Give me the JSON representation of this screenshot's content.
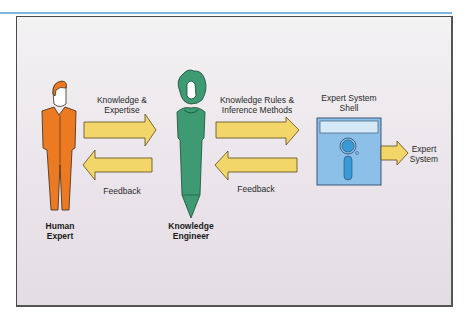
{
  "diagram": {
    "nodes": [
      {
        "id": "human-expert",
        "label_line1": "Human",
        "label_line2": "Expert",
        "figure_color": "#ec7a22"
      },
      {
        "id": "knowledge-engineer",
        "label_line1": "Knowledge",
        "label_line2": "Engineer",
        "figure_color": "#3d9a72"
      },
      {
        "id": "expert-system-shell",
        "label_line1": "Expert System",
        "label_line2": "Shell",
        "icon": "floppy-disk-icon",
        "icon_color": "#8cc0e8"
      },
      {
        "id": "expert-system",
        "label_line1": "Expert",
        "label_line2": "System"
      }
    ],
    "edges": [
      {
        "from": "human-expert",
        "to": "knowledge-engineer",
        "label_line1": "Knowledge &",
        "label_line2": "Expertise"
      },
      {
        "from": "knowledge-engineer",
        "to": "human-expert",
        "label": "Feedback"
      },
      {
        "from": "knowledge-engineer",
        "to": "expert-system-shell",
        "label_line1": "Knowledge Rules &",
        "label_line2": "Inference Methods"
      },
      {
        "from": "expert-system-shell",
        "to": "knowledge-engineer",
        "label": "Feedback"
      },
      {
        "from": "expert-system-shell",
        "to": "expert-system"
      }
    ],
    "arrow_color": "#f3d66a",
    "accent_line_color": "#7fb6df"
  }
}
